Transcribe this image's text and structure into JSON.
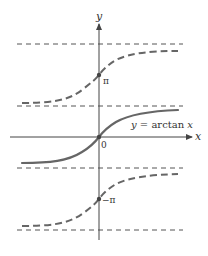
{
  "diagram": {
    "colors": {
      "axis": "#555555",
      "curve": "#666666",
      "asymptote": "#555555",
      "background": "#ffffff"
    },
    "axes": {
      "x_label": "x",
      "y_label": "y",
      "origin_label": "0"
    },
    "curve_label": "y = arctan x",
    "curve_label_parts": {
      "y": "y",
      "eq": " = arctan ",
      "x": "x"
    },
    "branch_labels": {
      "upper": "π",
      "lower": "−π"
    },
    "asymptotes": [
      "3π/2",
      "π/2",
      "−π/2",
      "−3π/2"
    ],
    "branches": [
      {
        "name": "principal branch",
        "style": "solid",
        "center": "0"
      },
      {
        "name": "upper branch",
        "style": "dashed",
        "center": "π"
      },
      {
        "name": "lower branch",
        "style": "dashed",
        "center": "−π"
      }
    ]
  }
}
